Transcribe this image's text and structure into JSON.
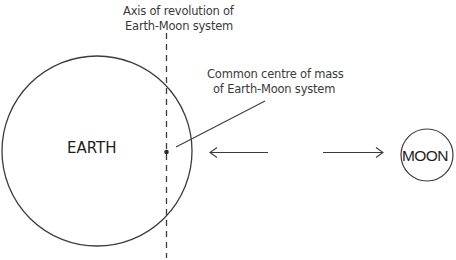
{
  "diagram": {
    "axis_label": {
      "line1": "Axis of revolution of",
      "line2": "Earth-Moon system"
    },
    "centre_of_mass_label": {
      "line1": "Common centre of mass",
      "line2": "of Earth-Moon system"
    },
    "earth_label": "EARTH",
    "moon_label": "MOON",
    "colors": {
      "stroke": "#3c3c3c",
      "text": "#3a3a3a",
      "background": "#ffffff"
    }
  }
}
